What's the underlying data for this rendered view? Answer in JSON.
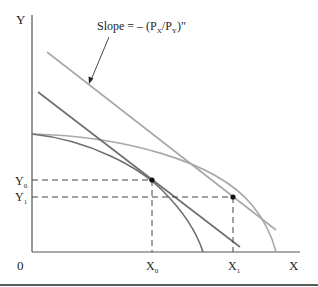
{
  "figure": {
    "axes": {
      "y_label": "Y",
      "x_label": "X",
      "origin_label": "0"
    },
    "ticks": {
      "y0": {
        "base": "Y",
        "sub": "0"
      },
      "y1": {
        "base": "Y",
        "sub": "1"
      },
      "x0": {
        "base": "X",
        "sub": "0"
      },
      "x1": {
        "base": "X",
        "sub": "1"
      }
    },
    "annotation": {
      "prefix": "Slope = – (P",
      "sub_x": "X",
      "mid": "/P",
      "sub_y": "Y",
      "suffix": ")\""
    },
    "curves": [
      {
        "name": "initial-production-possibility-frontier",
        "description": "inner PPF, tangent to inner price line at (X0, Y0)"
      },
      {
        "name": "expanded-production-possibility-frontier",
        "description": "outer PPF, tangent to outer price line at (X1, Y1)"
      },
      {
        "name": "initial-price-line",
        "description": "steeper relative price line through (X0, Y0)"
      },
      {
        "name": "new-price-line",
        "description": "flatter relative price line through (X1, Y1), slope = -(Px/Py)\""
      }
    ],
    "points": [
      {
        "name": "equilibrium-0",
        "x_label": "X0",
        "y_label": "Y0"
      },
      {
        "name": "equilibrium-1",
        "x_label": "X1",
        "y_label": "Y1"
      }
    ],
    "colors": {
      "axis": "#555555",
      "inner_curves": "#6e6e6e",
      "outer_curves": "#a8a8a8",
      "dashed": "#444444",
      "point": "#111111",
      "rule": "#5a5a5a"
    }
  }
}
